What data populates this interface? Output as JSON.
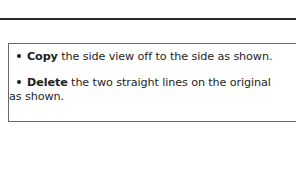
{
  "instructions": [
    {
      "keyword": "Copy",
      "text": " the side view off to the side as shown."
    },
    {
      "keyword": "Delete",
      "text": " the two straight lines on the original",
      "continuation": "as shown."
    }
  ]
}
